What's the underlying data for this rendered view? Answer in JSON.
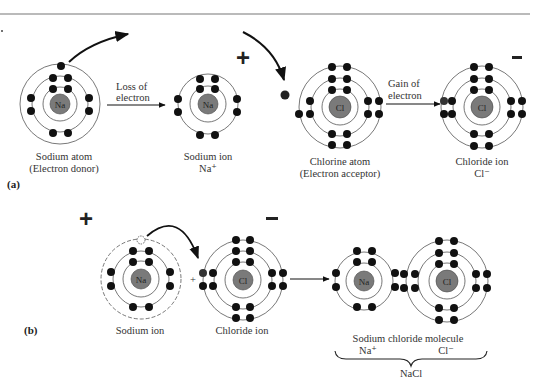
{
  "figure": {
    "panel_a": {
      "label": "(a)",
      "sodium_atom": {
        "symbol": "Na",
        "caption_line1": "Sodium atom",
        "caption_line2": "(Electron donor)",
        "shells": [
          2,
          8,
          1
        ]
      },
      "loss_arrow": {
        "line1": "Loss of",
        "line2": "electron"
      },
      "sodium_ion": {
        "symbol": "Na",
        "caption_line1": "Sodium ion",
        "caption_line2": "Na⁺",
        "shells": [
          2,
          8
        ],
        "charge": "+"
      },
      "chlorine_atom": {
        "symbol": "Cl",
        "caption_line1": "Chlorine atom",
        "caption_line2": "(Electron acceptor)",
        "shells": [
          2,
          8,
          7
        ]
      },
      "gain_arrow": {
        "line1": "Gain of",
        "line2": "electron"
      },
      "chloride_ion": {
        "symbol": "Cl",
        "caption_line1": "Chloride ion",
        "caption_line2": "Cl⁻",
        "shells": [
          2,
          8,
          8
        ],
        "charge": "–"
      }
    },
    "panel_b": {
      "label": "(b)",
      "sodium_ion": {
        "symbol": "Na",
        "caption": "Sodium ion",
        "charge": "+"
      },
      "plus_sign": "+",
      "chloride_ion": {
        "symbol": "Cl",
        "caption": "Chloride ion",
        "charge": "–"
      },
      "molecule": {
        "na_symbol": "Na",
        "cl_symbol": "Cl",
        "caption": "Sodium chloride molecule",
        "na_label": "Na⁺",
        "cl_label": "Cl⁻",
        "formula": "NaCl"
      }
    }
  },
  "colors": {
    "nucleus": "#7a7a7a",
    "electron": "#111111",
    "orbit": "#555555",
    "rule": "#666666"
  }
}
